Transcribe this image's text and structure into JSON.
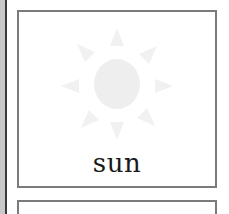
{
  "cards": [
    {
      "label": "sun",
      "icon": "sun-icon",
      "icon_color": "#f1f1f1"
    },
    {
      "label": "",
      "icon": ""
    }
  ],
  "colors": {
    "card_border": "#7b7b7b",
    "left_strip": "#c9c9c9",
    "left_line": "#3a3a3a",
    "label_text": "#1a1a1a"
  }
}
